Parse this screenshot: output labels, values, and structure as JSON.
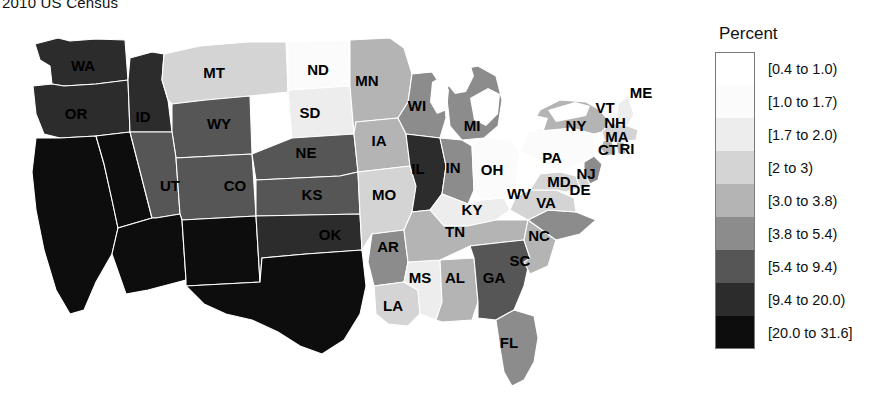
{
  "title": "2010 US Census",
  "legend": {
    "title": "Percent",
    "bins": [
      {
        "label": "[0.4 to 1.0)",
        "color": "#ffffff"
      },
      {
        "label": "[1.0 to 1.7)",
        "color": "#fbfbfb"
      },
      {
        "label": "[1.7 to 2.0)",
        "color": "#ededed"
      },
      {
        "label": "[2 to 3)",
        "color": "#d4d4d4"
      },
      {
        "label": "[3.0 to 3.8)",
        "color": "#b4b4b4"
      },
      {
        "label": "[3.8 to 5.4)",
        "color": "#8c8c8c"
      },
      {
        "label": "[5.4 to 9.4)",
        "color": "#565656"
      },
      {
        "label": "[9.4 to 20.0)",
        "color": "#2c2c2c"
      },
      {
        "label": "[20.0 to 31.6]",
        "color": "#0d0d0d"
      }
    ]
  },
  "chart_data": {
    "type": "map",
    "title": "2010 US Census",
    "value_label": "Percent",
    "legend_position": "right",
    "bin_edges": [
      0.4,
      1.0,
      1.7,
      2.0,
      3.0,
      3.8,
      5.4,
      9.4,
      20.0,
      31.6
    ],
    "bin_labels": [
      "[0.4 to 1.0)",
      "[1.0 to 1.7)",
      "[1.7 to 2.0)",
      "[2 to 3)",
      "[3.0 to 3.8)",
      "[3.8 to 5.4)",
      "[5.4 to 9.4)",
      "[9.4 to 20.0)",
      "[20.0 to 31.6]"
    ],
    "bin_colors": [
      "#ffffff",
      "#fbfbfb",
      "#ededed",
      "#d4d4d4",
      "#b4b4b4",
      "#8c8c8c",
      "#565656",
      "#2c2c2c",
      "#0d0d0d"
    ],
    "states": [
      {
        "code": "WA",
        "bin": 7,
        "color": "#2c2c2c"
      },
      {
        "code": "OR",
        "bin": 7,
        "color": "#2c2c2c"
      },
      {
        "code": "CA",
        "bin": 8,
        "color": "#0d0d0d"
      },
      {
        "code": "NV",
        "bin": 8,
        "color": "#0d0d0d"
      },
      {
        "code": "ID",
        "bin": 7,
        "color": "#2c2c2c"
      },
      {
        "code": "MT",
        "bin": 3,
        "color": "#d4d4d4"
      },
      {
        "code": "WY",
        "bin": 6,
        "color": "#565656"
      },
      {
        "code": "UT",
        "bin": 6,
        "color": "#565656"
      },
      {
        "code": "AZ",
        "bin": 8,
        "color": "#0d0d0d"
      },
      {
        "code": "CO",
        "bin": 6,
        "color": "#565656"
      },
      {
        "code": "NM",
        "bin": 8,
        "color": "#0d0d0d"
      },
      {
        "code": "ND",
        "bin": 1,
        "color": "#fbfbfb"
      },
      {
        "code": "SD",
        "bin": 2,
        "color": "#ededed"
      },
      {
        "code": "NE",
        "bin": 6,
        "color": "#565656"
      },
      {
        "code": "KS",
        "bin": 6,
        "color": "#565656"
      },
      {
        "code": "OK",
        "bin": 7,
        "color": "#2c2c2c"
      },
      {
        "code": "TX",
        "bin": 8,
        "color": "#0d0d0d"
      },
      {
        "code": "MN",
        "bin": 4,
        "color": "#b4b4b4"
      },
      {
        "code": "IA",
        "bin": 4,
        "color": "#b4b4b4"
      },
      {
        "code": "MO",
        "bin": 3,
        "color": "#d4d4d4"
      },
      {
        "code": "AR",
        "bin": 5,
        "color": "#8c8c8c"
      },
      {
        "code": "LA",
        "bin": 3,
        "color": "#d4d4d4"
      },
      {
        "code": "WI",
        "bin": 5,
        "color": "#8c8c8c"
      },
      {
        "code": "IL",
        "bin": 7,
        "color": "#2c2c2c"
      },
      {
        "code": "MI",
        "bin": 5,
        "color": "#8c8c8c"
      },
      {
        "code": "IN",
        "bin": 5,
        "color": "#8c8c8c"
      },
      {
        "code": "OH",
        "bin": 1,
        "color": "#fbfbfb"
      },
      {
        "code": "KY",
        "bin": 2,
        "color": "#ededed"
      },
      {
        "code": "TN",
        "bin": 4,
        "color": "#b4b4b4"
      },
      {
        "code": "MS",
        "bin": 2,
        "color": "#ededed"
      },
      {
        "code": "AL",
        "bin": 4,
        "color": "#b4b4b4"
      },
      {
        "code": "GA",
        "bin": 6,
        "color": "#565656"
      },
      {
        "code": "FL",
        "bin": 5,
        "color": "#8c8c8c"
      },
      {
        "code": "SC",
        "bin": 4,
        "color": "#b4b4b4"
      },
      {
        "code": "NC",
        "bin": 5,
        "color": "#8c8c8c"
      },
      {
        "code": "VA",
        "bin": 3,
        "color": "#d4d4d4"
      },
      {
        "code": "WV",
        "bin": 0,
        "color": "#ffffff"
      },
      {
        "code": "MD",
        "bin": 3,
        "color": "#d4d4d4"
      },
      {
        "code": "DE",
        "bin": 3,
        "color": "#d4d4d4"
      },
      {
        "code": "PA",
        "bin": 1,
        "color": "#fbfbfb"
      },
      {
        "code": "NJ",
        "bin": 5,
        "color": "#8c8c8c"
      },
      {
        "code": "NY",
        "bin": 4,
        "color": "#b4b4b4"
      },
      {
        "code": "CT",
        "bin": 4,
        "color": "#b4b4b4"
      },
      {
        "code": "RI",
        "bin": 4,
        "color": "#b4b4b4"
      },
      {
        "code": "MA",
        "bin": 3,
        "color": "#d4d4d4"
      },
      {
        "code": "VT",
        "bin": 1,
        "color": "#fbfbfb"
      },
      {
        "code": "NH",
        "bin": 2,
        "color": "#ededed"
      },
      {
        "code": "ME",
        "bin": 0,
        "color": "#ffffff"
      }
    ]
  },
  "state_labels": [
    {
      "code": "WA",
      "x": 83,
      "y": 53
    },
    {
      "code": "OR",
      "x": 76,
      "y": 101
    },
    {
      "code": "ID",
      "x": 143,
      "y": 104
    },
    {
      "code": "MT",
      "x": 214,
      "y": 60
    },
    {
      "code": "WY",
      "x": 219,
      "y": 111
    },
    {
      "code": "UT",
      "x": 170,
      "y": 173
    },
    {
      "code": "CO",
      "x": 235,
      "y": 173
    },
    {
      "code": "ND",
      "x": 318,
      "y": 57
    },
    {
      "code": "SD",
      "x": 310,
      "y": 100
    },
    {
      "code": "NE",
      "x": 306,
      "y": 140
    },
    {
      "code": "KS",
      "x": 312,
      "y": 182
    },
    {
      "code": "OK",
      "x": 330,
      "y": 222
    },
    {
      "code": "MN",
      "x": 367,
      "y": 68
    },
    {
      "code": "IA",
      "x": 379,
      "y": 128
    },
    {
      "code": "MO",
      "x": 384,
      "y": 182
    },
    {
      "code": "AR",
      "x": 388,
      "y": 234
    },
    {
      "code": "LA",
      "x": 393,
      "y": 293
    },
    {
      "code": "MS",
      "x": 420,
      "y": 265
    },
    {
      "code": "AL",
      "x": 455,
      "y": 265
    },
    {
      "code": "WI",
      "x": 417,
      "y": 93
    },
    {
      "code": "IL",
      "x": 418,
      "y": 156
    },
    {
      "code": "IN",
      "x": 453,
      "y": 155
    },
    {
      "code": "MI",
      "x": 472,
      "y": 113
    },
    {
      "code": "OH",
      "x": 492,
      "y": 157
    },
    {
      "code": "KY",
      "x": 472,
      "y": 197
    },
    {
      "code": "TN",
      "x": 455,
      "y": 219
    },
    {
      "code": "GA",
      "x": 494,
      "y": 265
    },
    {
      "code": "FL",
      "x": 509,
      "y": 330
    },
    {
      "code": "SC",
      "x": 520,
      "y": 248
    },
    {
      "code": "NC",
      "x": 539,
      "y": 223
    },
    {
      "code": "WV",
      "x": 519,
      "y": 181
    },
    {
      "code": "VA",
      "x": 546,
      "y": 190
    },
    {
      "code": "MD",
      "x": 559,
      "y": 169
    },
    {
      "code": "DE",
      "x": 580,
      "y": 177
    },
    {
      "code": "NJ",
      "x": 586,
      "y": 161
    },
    {
      "code": "PA",
      "x": 552,
      "y": 145
    },
    {
      "code": "NY",
      "x": 576,
      "y": 113
    },
    {
      "code": "VT",
      "x": 605,
      "y": 95
    },
    {
      "code": "NH",
      "x": 615,
      "y": 110
    },
    {
      "code": "MA",
      "x": 617,
      "y": 124
    },
    {
      "code": "CT",
      "x": 608,
      "y": 137
    },
    {
      "code": "RI",
      "x": 627,
      "y": 136
    },
    {
      "code": "ME",
      "x": 641,
      "y": 80
    }
  ]
}
